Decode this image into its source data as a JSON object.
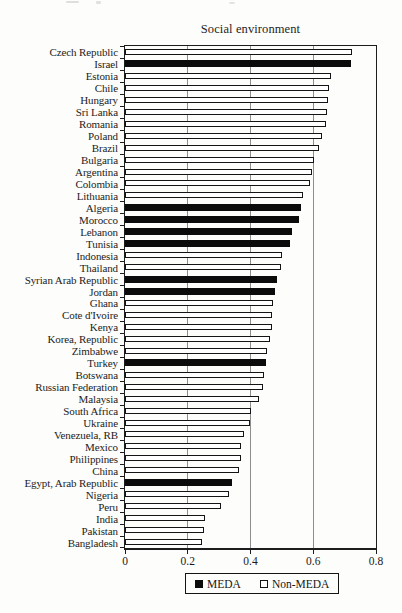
{
  "page": {
    "kind": "scanned book figure",
    "colors": {
      "background": "#fdfdfb",
      "text": "#1c1c1c",
      "bar_filled": "#0b0b0b",
      "bar_open_fill": "#ffffff",
      "bar_outline": "#141414",
      "gridline": "#8e8e8c",
      "axis": "#1d1d1d"
    }
  },
  "legend": {
    "items": [
      {
        "label": "MEDA",
        "style": "filled-black-square"
      },
      {
        "label": "Non-MEDA",
        "style": "open-white-square"
      }
    ]
  },
  "chart_data": {
    "type": "bar",
    "orientation": "horizontal",
    "title": "Social environment",
    "xlabel": "",
    "ylabel": "",
    "xlim": [
      0,
      0.8
    ],
    "xticks": [
      0,
      0.2,
      0.4,
      0.6,
      0.8
    ],
    "xtick_labels": [
      "0",
      "0.2",
      "0.4",
      "0.6",
      "0.8"
    ],
    "gridlines_at": [
      0.2,
      0.4,
      0.6
    ],
    "grid": "vertical gridlines at 0.2 / 0.4 / 0.6, full plot border",
    "legend_position": "bottom-center",
    "sort": "descending top to bottom",
    "bars": [
      {
        "label": "Czech Republic",
        "value": 0.725,
        "group": "Non-MEDA"
      },
      {
        "label": "Israel",
        "value": 0.72,
        "group": "MEDA"
      },
      {
        "label": "Estonia",
        "value": 0.655,
        "group": "Non-MEDA"
      },
      {
        "label": "Chile",
        "value": 0.65,
        "group": "Non-MEDA"
      },
      {
        "label": "Hungary",
        "value": 0.648,
        "group": "Non-MEDA"
      },
      {
        "label": "Sri Lanka",
        "value": 0.643,
        "group": "Non-MEDA"
      },
      {
        "label": "Romania",
        "value": 0.641,
        "group": "Non-MEDA"
      },
      {
        "label": "Poland",
        "value": 0.627,
        "group": "Non-MEDA"
      },
      {
        "label": "Brazil",
        "value": 0.618,
        "group": "Non-MEDA"
      },
      {
        "label": "Bulgaria",
        "value": 0.602,
        "group": "Non-MEDA"
      },
      {
        "label": "Argentina",
        "value": 0.597,
        "group": "Non-MEDA"
      },
      {
        "label": "Colombia",
        "value": 0.591,
        "group": "Non-MEDA"
      },
      {
        "label": "Lithuania",
        "value": 0.566,
        "group": "Non-MEDA"
      },
      {
        "label": "Algeria",
        "value": 0.561,
        "group": "MEDA"
      },
      {
        "label": "Morocco",
        "value": 0.556,
        "group": "MEDA"
      },
      {
        "label": "Lebanon",
        "value": 0.533,
        "group": "MEDA"
      },
      {
        "label": "Tunisia",
        "value": 0.526,
        "group": "MEDA"
      },
      {
        "label": "Indonesia",
        "value": 0.501,
        "group": "Non-MEDA"
      },
      {
        "label": "Thailand",
        "value": 0.497,
        "group": "Non-MEDA"
      },
      {
        "label": "Syrian Arab Republic",
        "value": 0.486,
        "group": "MEDA"
      },
      {
        "label": "Jordan",
        "value": 0.479,
        "group": "MEDA"
      },
      {
        "label": "Ghana",
        "value": 0.473,
        "group": "Non-MEDA"
      },
      {
        "label": "Cote d'Ivoire",
        "value": 0.47,
        "group": "Non-MEDA"
      },
      {
        "label": "Kenya",
        "value": 0.467,
        "group": "Non-MEDA"
      },
      {
        "label": "Korea, Republic",
        "value": 0.463,
        "group": "Non-MEDA"
      },
      {
        "label": "Zimbabwe",
        "value": 0.453,
        "group": "Non-MEDA"
      },
      {
        "label": "Turkey",
        "value": 0.448,
        "group": "MEDA"
      },
      {
        "label": "Botswana",
        "value": 0.444,
        "group": "Non-MEDA"
      },
      {
        "label": "Russian Federation",
        "value": 0.441,
        "group": "Non-MEDA"
      },
      {
        "label": "Malaysia",
        "value": 0.428,
        "group": "Non-MEDA"
      },
      {
        "label": "South Africa",
        "value": 0.403,
        "group": "Non-MEDA"
      },
      {
        "label": "Ukraine",
        "value": 0.399,
        "group": "Non-MEDA"
      },
      {
        "label": "Venezuela, RB",
        "value": 0.378,
        "group": "Non-MEDA"
      },
      {
        "label": "Mexico",
        "value": 0.371,
        "group": "Non-MEDA"
      },
      {
        "label": "Philippines",
        "value": 0.369,
        "group": "Non-MEDA"
      },
      {
        "label": "China",
        "value": 0.363,
        "group": "Non-MEDA"
      },
      {
        "label": "Egypt, Arab Republic",
        "value": 0.34,
        "group": "MEDA"
      },
      {
        "label": "Nigeria",
        "value": 0.332,
        "group": "Non-MEDA"
      },
      {
        "label": "Peru",
        "value": 0.306,
        "group": "Non-MEDA"
      },
      {
        "label": "India",
        "value": 0.256,
        "group": "Non-MEDA"
      },
      {
        "label": "Pakistan",
        "value": 0.253,
        "group": "Non-MEDA"
      },
      {
        "label": "Bangladesh",
        "value": 0.247,
        "group": "Non-MEDA"
      }
    ]
  }
}
